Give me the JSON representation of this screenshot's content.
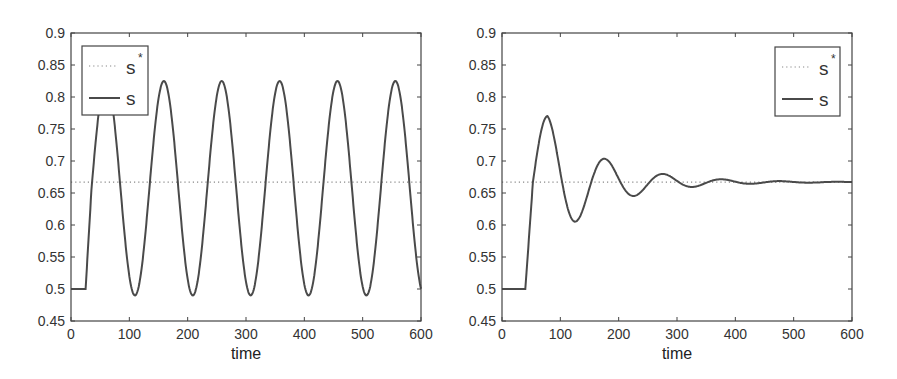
{
  "chart_data": [
    {
      "type": "line",
      "title": "",
      "xlabel": "time",
      "ylabel": "",
      "xlim": [
        0,
        600
      ],
      "ylim": [
        0.45,
        0.9
      ],
      "xticks": [
        "0",
        "100",
        "200",
        "300",
        "400",
        "500",
        "600"
      ],
      "yticks": [
        "0.45",
        "0.5",
        "0.55",
        "0.6",
        "0.65",
        "0.7",
        "0.75",
        "0.8",
        "0.85",
        "0.9"
      ],
      "grid": false,
      "legend": {
        "position": "upper-left",
        "entries": [
          {
            "label": "s",
            "superscript": "*",
            "style": "dotted"
          },
          {
            "label": "s",
            "superscript": "",
            "style": "solid"
          }
        ]
      },
      "series": [
        {
          "name": "s*",
          "style": "dotted",
          "x": [
            0,
            600
          ],
          "values": [
            0.667,
            0.667
          ]
        },
        {
          "name": "s",
          "style": "solid",
          "x": [
            0,
            25,
            60,
            110,
            158,
            208,
            258,
            308,
            357,
            407,
            456,
            506,
            555,
            600
          ],
          "values": [
            0.5,
            0.5,
            0.825,
            0.49,
            0.825,
            0.49,
            0.825,
            0.49,
            0.825,
            0.49,
            0.825,
            0.49,
            0.825,
            0.515
          ],
          "model": {
            "kind": "sustained",
            "start": 25,
            "base": 0.5,
            "mid": 0.6575,
            "amp": 0.1675,
            "period": 99.2,
            "first_peak": 60
          }
        }
      ]
    },
    {
      "type": "line",
      "title": "",
      "xlabel": "time",
      "ylabel": "",
      "xlim": [
        0,
        600
      ],
      "ylim": [
        0.45,
        0.9
      ],
      "xticks": [
        "0",
        "100",
        "200",
        "300",
        "400",
        "500",
        "600"
      ],
      "yticks": [
        "0.45",
        "0.5",
        "0.55",
        "0.6",
        "0.65",
        "0.7",
        "0.75",
        "0.8",
        "0.85",
        "0.9"
      ],
      "grid": false,
      "legend": {
        "position": "upper-right",
        "entries": [
          {
            "label": "s",
            "superscript": "*",
            "style": "dotted"
          },
          {
            "label": "s",
            "superscript": "",
            "style": "solid"
          }
        ]
      },
      "series": [
        {
          "name": "s*",
          "style": "dotted",
          "x": [
            0,
            600
          ],
          "values": [
            0.667,
            0.667
          ]
        },
        {
          "name": "s",
          "style": "solid",
          "x": [
            0,
            40,
            78,
            128,
            178,
            228,
            278,
            328,
            378,
            428,
            478,
            600
          ],
          "values": [
            0.5,
            0.5,
            0.77,
            0.605,
            0.7,
            0.648,
            0.677,
            0.661,
            0.67,
            0.665,
            0.668,
            0.667
          ],
          "model": {
            "kind": "damped",
            "start": 40,
            "base": 0.5,
            "mid": 0.667,
            "amp": 0.103,
            "period": 100,
            "first_peak": 78,
            "decay": 0.0105
          }
        }
      ]
    }
  ],
  "charts": [
    {
      "xlabel": "time",
      "legend": {
        "dotted_label": "s",
        "dotted_sup": "*",
        "solid_label": "s"
      }
    },
    {
      "xlabel": "time",
      "legend": {
        "dotted_label": "s",
        "dotted_sup": "*",
        "solid_label": "s"
      }
    }
  ],
  "colors": {
    "line": "#4a4a4a",
    "axis": "#444444",
    "reference": "#888888"
  }
}
